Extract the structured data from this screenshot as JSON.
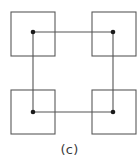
{
  "figure": {
    "caption": "(c)",
    "caption_x": 0,
    "caption_y": 143,
    "width": 139,
    "height": 164,
    "background": "#ffffff",
    "stroke_color": "#595959",
    "connector_color": "#555555",
    "node_color": "#1a1a1a",
    "stroke_width": 1.1,
    "connector_width": 1.1,
    "node_radius": 2.3,
    "squares": [
      {
        "name": "top-left-square",
        "x": 11,
        "y": 12,
        "size": 44
      },
      {
        "name": "top-right-square",
        "x": 92,
        "y": 12,
        "size": 44
      },
      {
        "name": "bottom-left-square",
        "x": 11,
        "y": 90,
        "size": 44
      },
      {
        "name": "bottom-right-square",
        "x": 92,
        "y": 90,
        "size": 44
      }
    ],
    "nodes": [
      {
        "name": "node-top-left",
        "cx": 33,
        "cy": 32
      },
      {
        "name": "node-top-right",
        "cx": 113,
        "cy": 32
      },
      {
        "name": "node-bottom-left",
        "cx": 33,
        "cy": 112
      },
      {
        "name": "node-bottom-right",
        "cx": 113,
        "cy": 112
      }
    ],
    "connectors": [
      {
        "name": "connector-top",
        "x1": 33,
        "y1": 32,
        "x2": 113,
        "y2": 32
      },
      {
        "name": "connector-right",
        "x1": 113,
        "y1": 32,
        "x2": 113,
        "y2": 112
      },
      {
        "name": "connector-bottom",
        "x1": 113,
        "y1": 112,
        "x2": 33,
        "y2": 112
      },
      {
        "name": "connector-left",
        "x1": 33,
        "y1": 112,
        "x2": 33,
        "y2": 32
      }
    ]
  }
}
